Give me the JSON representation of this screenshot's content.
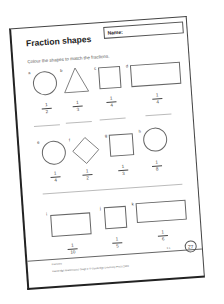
{
  "worksheet": {
    "title": "Fraction shapes",
    "name_label": "Name:",
    "instruction": "Colour the shapes to match the fractions.",
    "rows": [
      [
        {
          "label": "a",
          "shape": "circle",
          "numerator": "1",
          "denominator": "2"
        },
        {
          "label": "b",
          "shape": "triangle",
          "numerator": "1",
          "denominator": "3"
        },
        {
          "label": "c",
          "shape": "square",
          "numerator": "1",
          "denominator": "4"
        },
        {
          "label": "d",
          "shape": "rectangle",
          "numerator": "1",
          "denominator": "4"
        }
      ],
      [
        {
          "label": "e",
          "shape": "circle",
          "numerator": "1",
          "denominator": "4"
        },
        {
          "label": "f",
          "shape": "diamond",
          "numerator": "1",
          "denominator": "2"
        },
        {
          "label": "g",
          "shape": "square",
          "numerator": "1",
          "denominator": "3"
        },
        {
          "label": "h",
          "shape": "circle",
          "numerator": "1",
          "denominator": "8"
        }
      ],
      [
        {
          "label": "i",
          "shape": "rectangle",
          "numerator": "1",
          "denominator": "10"
        },
        {
          "label": "j",
          "shape": "square",
          "numerator": "1",
          "denominator": "5"
        },
        {
          "label": "k",
          "shape": "rectangle",
          "numerator": "1",
          "denominator": "6"
        }
      ]
    ],
    "footer": {
      "topic": "Fractions",
      "copyright": "Cambridge Mathematics Stage 2 © Cambridge University Press 2020",
      "code": "3.1",
      "page_number": "27"
    }
  }
}
